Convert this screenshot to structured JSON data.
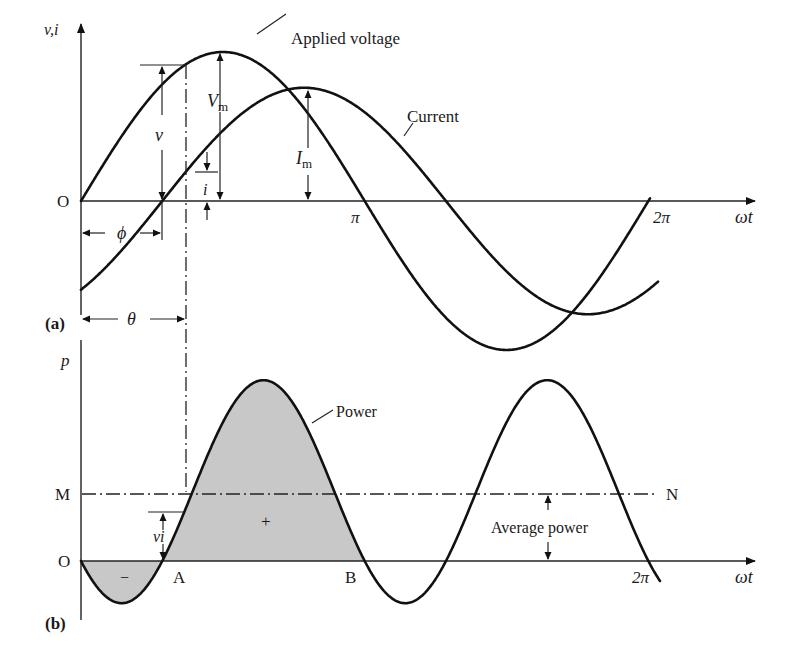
{
  "figure": {
    "panel_a": {
      "label": "(a)",
      "y_axis_label": "v,i",
      "x_axis_label": "ωt",
      "origin_label": "O",
      "tick_pi": "π",
      "tick_2pi": "2π",
      "voltage_label": "Applied voltage",
      "current_label": "Current",
      "vm_label": "V",
      "vm_sub": "m",
      "im_label": "I",
      "im_sub": "m",
      "v_label": "v",
      "i_label": "i",
      "phi_label": "ϕ",
      "theta_label": "θ"
    },
    "panel_b": {
      "label": "(b)",
      "y_axis_label": "p",
      "x_axis_label": "ωt",
      "origin_label": "O",
      "m_label": "M",
      "n_label": "N",
      "a_label": "A",
      "b_label": "B",
      "tick_2pi": "2π",
      "power_label": "Power",
      "avg_power_label": "Average power",
      "vi_label": "vi",
      "minus_sign": "−",
      "plus_sign": "+"
    },
    "colors": {
      "stroke": "#111111",
      "fill_area": "#c8c8c8",
      "background": "#ffffff"
    }
  },
  "chart_data": {
    "type": "line",
    "panels": [
      {
        "id": "a",
        "xlabel": "ωt",
        "ylabel": "v,i",
        "x_ticks": [
          "O",
          "π",
          "2π"
        ],
        "x_range_rad": [
          0,
          6.4
        ],
        "series": [
          {
            "name": "Applied voltage",
            "function": "Vm·sin(ωt)",
            "amplitude_rel": 1.0,
            "phase_rad": 0
          },
          {
            "name": "Current",
            "function": "Im·sin(ωt − φ)",
            "amplitude_rel": 0.76,
            "phase_rad": -0.9
          }
        ],
        "annotations": [
          "Vm",
          "Im",
          "v",
          "i",
          "φ",
          "θ"
        ]
      },
      {
        "id": "b",
        "xlabel": "ωt",
        "ylabel": "p",
        "x_ticks": [
          "O",
          "A",
          "B",
          "2π"
        ],
        "series": [
          {
            "name": "Power",
            "function": "p = v·i",
            "peak_rel": 0.81,
            "trough_rel": -0.19,
            "average_rel": 0.31
          }
        ],
        "annotations": [
          "M",
          "N",
          "Average power",
          "vi",
          "−",
          "+"
        ]
      }
    ]
  }
}
